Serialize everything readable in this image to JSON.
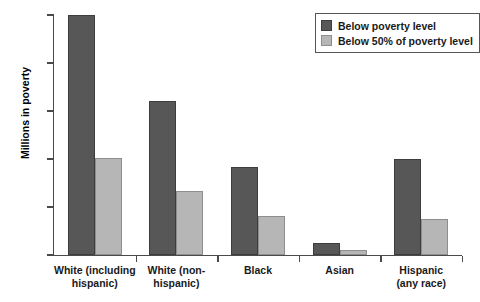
{
  "chart_data": {
    "type": "bar",
    "title": "",
    "xlabel": "",
    "ylabel": "Millions in poverty",
    "ylim": [
      0,
      50
    ],
    "yticks": [
      0,
      10,
      20,
      30,
      40,
      50
    ],
    "ytick_labels": [
      "0",
      "10",
      "20",
      "30",
      "40",
      "50"
    ],
    "grid": false,
    "legend_position": "top-right",
    "categories": [
      "White (including\nhispanic)",
      "White (non-\nhispanic)",
      "Black",
      "Asian",
      "Hispanic\n(any race)"
    ],
    "category_lines": [
      [
        "White (including",
        "hispanic)"
      ],
      [
        "White (non-",
        "hispanic)"
      ],
      [
        "Black",
        ""
      ],
      [
        "Asian",
        ""
      ],
      [
        "Hispanic",
        "(any race)"
      ]
    ],
    "series": [
      {
        "name": "Below poverty level",
        "color": "#575757",
        "values": [
          50.0,
          32.0,
          18.3,
          2.5,
          20.0
        ]
      },
      {
        "name": "Below 50% of poverty level",
        "color": "#b6b6b6",
        "values": [
          20.3,
          13.4,
          8.2,
          1.0,
          7.4
        ]
      }
    ]
  },
  "legend": {
    "items": [
      {
        "label": "Below poverty level",
        "swatch": "dark-swatch-icon"
      },
      {
        "label": "Below 50% of poverty level",
        "swatch": "light-swatch-icon"
      }
    ]
  }
}
